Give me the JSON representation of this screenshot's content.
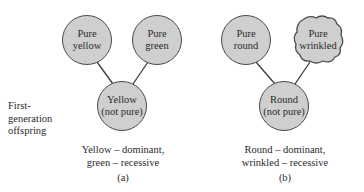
{
  "diagram": {
    "side_label": [
      "First-",
      "generation",
      "offspring"
    ],
    "panel_a": {
      "parent_left": [
        "Pure",
        "yellow"
      ],
      "parent_right": [
        "Pure",
        "green"
      ],
      "offspring": [
        "Yellow",
        "(not pure)"
      ],
      "caption": [
        "Yellow – dominant,",
        "green – recessive"
      ],
      "label": "(a)"
    },
    "panel_b": {
      "parent_left": [
        "Pure",
        "round"
      ],
      "parent_right": [
        "Pure",
        "wrinkled"
      ],
      "offspring": [
        "Round",
        "(not pure)"
      ],
      "caption": [
        "Round – dominant,",
        "wrinkled – recessive"
      ],
      "label": "(b)"
    },
    "colors": {
      "node_fill": "#cfcfcf",
      "node_stroke": "#4a4a4a",
      "line": "#3a3a3a"
    }
  }
}
